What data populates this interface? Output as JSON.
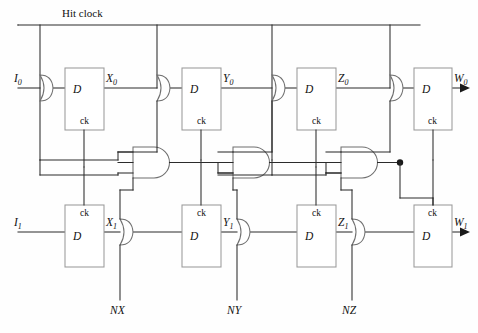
{
  "diagram": {
    "title_label": "Hit clock",
    "caption": "",
    "inputs": [
      {
        "id": "i0",
        "label": "I",
        "sub": "0"
      },
      {
        "id": "i1",
        "label": "I",
        "sub": "1"
      }
    ],
    "outputs": [
      {
        "id": "w0",
        "label": "W",
        "sub": "0"
      },
      {
        "id": "w1",
        "label": "W",
        "sub": "1"
      }
    ],
    "node_labels_top": [
      {
        "id": "x0",
        "label": "X",
        "sub": "0"
      },
      {
        "id": "y0",
        "label": "Y",
        "sub": "0"
      },
      {
        "id": "z0",
        "label": "Z",
        "sub": "0"
      },
      {
        "id": "w0",
        "label": "W",
        "sub": "0"
      }
    ],
    "node_labels_bottom": [
      {
        "id": "x1",
        "label": "X",
        "sub": "1"
      },
      {
        "id": "y1",
        "label": "Y",
        "sub": "1"
      },
      {
        "id": "z1",
        "label": "Z",
        "sub": "1"
      },
      {
        "id": "w1",
        "label": "W",
        "sub": "1"
      }
    ],
    "control_inputs": [
      {
        "id": "nx",
        "label": "NX"
      },
      {
        "id": "ny",
        "label": "NY"
      },
      {
        "id": "nz",
        "label": "NZ"
      }
    ],
    "flipflops_top": [
      {
        "id": "ff-x0",
        "d_label": "D",
        "ck_label": "ck"
      },
      {
        "id": "ff-y0",
        "d_label": "D",
        "ck_label": "ck"
      },
      {
        "id": "ff-z0",
        "d_label": "D",
        "ck_label": "ck"
      },
      {
        "id": "ff-w0",
        "d_label": "D",
        "ck_label": "ck"
      }
    ],
    "flipflops_bottom": [
      {
        "id": "ff-x1",
        "d_label": "D",
        "ck_label": "ck"
      },
      {
        "id": "ff-y1",
        "d_label": "D",
        "ck_label": "ck"
      },
      {
        "id": "ff-z1",
        "d_label": "D",
        "ck_label": "ck"
      },
      {
        "id": "ff-w1",
        "d_label": "D",
        "ck_label": "ck"
      }
    ],
    "and_gates": [
      {
        "id": "and-1"
      },
      {
        "id": "and-2"
      },
      {
        "id": "and-3"
      }
    ],
    "or_gates": [
      {
        "id": "or-i0"
      },
      {
        "id": "or-x0"
      },
      {
        "id": "or-y0"
      },
      {
        "id": "or-z0"
      },
      {
        "id": "or-x1"
      },
      {
        "id": "or-y1"
      },
      {
        "id": "or-z1"
      }
    ],
    "colors": {
      "wire": "#2b2b2b",
      "gate_outline": "#6f6f6f",
      "box_outline": "#9a9a9a",
      "background": "#fefefe",
      "text": "#111111"
    }
  }
}
